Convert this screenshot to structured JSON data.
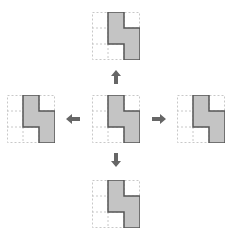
{
  "caption": {
    "text": "",
    "note": "top text line clipped at image edge; unreadable"
  },
  "diagram": {
    "grid": {
      "rows": 3,
      "cols": 3,
      "cell_px": 16,
      "line_color": "#c8c8c8",
      "line_style": "dashed"
    },
    "shape": {
      "fill": "#c4c4c4",
      "stroke": "#555555",
      "cells": [
        [
          0,
          1
        ],
        [
          1,
          1
        ],
        [
          1,
          2
        ],
        [
          2,
          2
        ]
      ],
      "description": "Z-like tetromino: middle column rows 1-2, right column rows 2-3"
    },
    "panels": [
      {
        "id": "top",
        "label": "moved up"
      },
      {
        "id": "left",
        "label": "moved left"
      },
      {
        "id": "center",
        "label": "original"
      },
      {
        "id": "right",
        "label": "moved right"
      },
      {
        "id": "bottom",
        "label": "moved down"
      }
    ],
    "arrows": [
      {
        "direction": "up",
        "color": "#666666"
      },
      {
        "direction": "left",
        "color": "#666666"
      },
      {
        "direction": "right",
        "color": "#666666"
      },
      {
        "direction": "down",
        "color": "#666666"
      }
    ]
  }
}
